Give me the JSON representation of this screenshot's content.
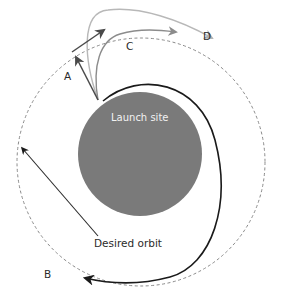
{
  "diagram": {
    "labels": {
      "planet": "Launch site",
      "orbit": "Desired orbit",
      "A": "A",
      "B": "B",
      "C": "C",
      "D": "D"
    },
    "colors": {
      "planet": "#7a7a7a",
      "orbit_dashed": "#8a8a8a",
      "trajectory_dark": "#1a1a1a",
      "trajectory_A": "#4a4a4a",
      "trajectory_C": "#8c8c8c",
      "trajectory_D": "#b8b8b8",
      "background": "#ffffff"
    },
    "elements": [
      {
        "id": "planet",
        "shape": "circle",
        "cx": 140,
        "cy": 152,
        "r": 62
      },
      {
        "id": "desired-orbit",
        "shape": "dashed-circle",
        "cx": 141,
        "cy": 160,
        "r": 125
      },
      {
        "id": "trajectory-A",
        "desc": "vertical ascent then horizontal burn arrow from launch site to orbit"
      },
      {
        "id": "trajectory-B",
        "desc": "long black arc around planet arriving at point B"
      },
      {
        "id": "trajectory-C",
        "desc": "gray curved trajectory to orbit"
      },
      {
        "id": "trajectory-D",
        "desc": "light gray looping trajectory to point D"
      }
    ]
  }
}
